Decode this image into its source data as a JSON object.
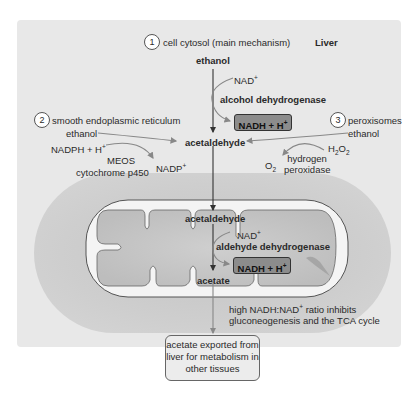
{
  "title": "Liver",
  "sections": {
    "cytosol": {
      "number": "1",
      "label": "cell cytosol (main mechanism)"
    },
    "ser": {
      "number": "2",
      "label": "smooth endoplasmic reticulum"
    },
    "peroxisomes": {
      "number": "3",
      "label": "peroxisomes"
    }
  },
  "main_pathway": {
    "ethanol": "ethanol",
    "nad": "NAD",
    "nad_sup": "+",
    "enzyme1": "alcohol dehydrogenase",
    "nadh_box": "NADH + H",
    "nadh_sup": "+",
    "acetaldehyde": "acetaldehyde"
  },
  "meos_pathway": {
    "ethanol": "ethanol",
    "nadph": "NADPH + H",
    "nadph_sup": "+",
    "nadp": "NADP",
    "nadp_sup": "+",
    "enzyme_line1": "MEOS",
    "enzyme_line2": "cytochrome p450"
  },
  "peroxisome_pathway": {
    "ethanol": "ethanol",
    "h2o2_h": "H",
    "h2o2_sub": "2",
    "h2o2_o": "O",
    "h2o2_sub2": "2",
    "o2": "O",
    "o2_sub": "2",
    "enzyme_line1": "hydrogen",
    "enzyme_line2": "peroxidase"
  },
  "mitochondrion": {
    "acetaldehyde": "acetaldehyde",
    "nad": "NAD",
    "nad_sup": "+",
    "enzyme2": "aldehyde dehydrogenase",
    "nadh_box": "NADH + H",
    "nadh_sup": "+",
    "acetate": "acetate"
  },
  "note": {
    "line1_pre": "high NADH:NAD",
    "line1_sup": "+",
    "line1_post": " ratio inhibits",
    "line2": "gluconeogenesis and the TCA cycle"
  },
  "export_box": {
    "line1": "acetate exported from",
    "line2": "liver for metabolism in",
    "line3": "other tissues"
  },
  "colors": {
    "panel": "#e8e8e8",
    "cell": "#c8c8c8",
    "mito_membrane": "#f4f4f4",
    "nadh_box": "#8c8c8c",
    "arrow_main": "#333333",
    "arrow_side": "#888888"
  }
}
